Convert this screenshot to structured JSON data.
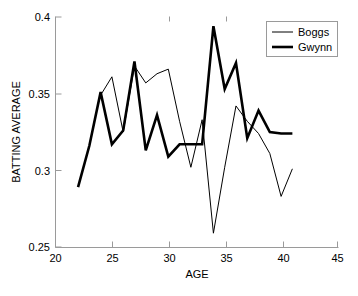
{
  "chart_data": {
    "type": "line",
    "title": "",
    "xlabel": "AGE",
    "ylabel": "BATTING AVERAGE",
    "xlim": [
      20,
      45
    ],
    "ylim": [
      0.25,
      0.4
    ],
    "xticks": [
      20,
      25,
      30,
      35,
      40,
      45
    ],
    "yticks": [
      0.25,
      0.3,
      0.35,
      0.4
    ],
    "xtick_labels": [
      "20",
      "25",
      "30",
      "35",
      "40",
      "45"
    ],
    "ytick_labels": [
      "0.25",
      "0.3",
      "0.35",
      "0.4"
    ],
    "grid": false,
    "legend_position": "top-right",
    "series": [
      {
        "name": "Boggs",
        "linewidth": "thin",
        "color": "#000000",
        "x": [
          24,
          25,
          26,
          27,
          28,
          29,
          30,
          31,
          32,
          33,
          34,
          35,
          36,
          37,
          38,
          39,
          40,
          41
        ],
        "y": [
          0.349,
          0.361,
          0.325,
          0.368,
          0.357,
          0.363,
          0.366,
          0.332,
          0.302,
          0.333,
          0.259,
          0.302,
          0.342,
          0.332,
          0.324,
          0.311,
          0.283,
          0.301
        ]
      },
      {
        "name": "Gwynn",
        "linewidth": "thick",
        "color": "#000000",
        "x": [
          22,
          23,
          24,
          25,
          26,
          27,
          28,
          29,
          30,
          31,
          32,
          33,
          34,
          35,
          36,
          37,
          38,
          39,
          40,
          41
        ],
        "y": [
          0.289,
          0.316,
          0.351,
          0.317,
          0.326,
          0.371,
          0.313,
          0.336,
          0.309,
          0.317,
          0.317,
          0.317,
          0.394,
          0.353,
          0.37,
          0.321,
          0.339,
          0.325,
          0.324,
          0.324
        ]
      }
    ],
    "legend_entries": [
      "Boggs",
      "Gwynn"
    ]
  },
  "axes": {
    "y_axis_label": "BATTING AVERAGE",
    "x_axis_label": "AGE"
  }
}
